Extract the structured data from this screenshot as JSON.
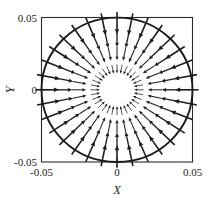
{
  "figure": {
    "name": "vector-field-plot"
  },
  "chart_data": {
    "type": "scatter",
    "subtype": "quiver-vector-field",
    "title": "",
    "subtitle": "",
    "xlabel": "X",
    "ylabel": "Y",
    "xlim": [
      -0.05,
      0.05
    ],
    "ylim": [
      -0.05,
      0.05
    ],
    "xticks": [
      -0.05,
      0,
      0.05
    ],
    "yticks": [
      -0.05,
      0,
      0.05
    ],
    "xticklabels": [
      "-0.05",
      "0",
      "0.05"
    ],
    "yticklabels": [
      "-0.05",
      "0",
      "0.05"
    ],
    "grid": false,
    "legend": null,
    "legend_position": "none",
    "frame": "box",
    "annotations": [],
    "boundary": {
      "shape": "circle",
      "center": [
        0,
        0
      ],
      "radius": 0.05,
      "description": "circular domain boundary inscribed in the square axes frame"
    },
    "field": {
      "description": "radially inward-pointing vector field; all arrows converge on the origin",
      "direction": "inward",
      "symmetry": "radial",
      "magnitude_rule": "arrow length increases with radial distance from the origin",
      "n_spokes": 32,
      "arrows_per_spoke": 4,
      "spoke_angles_deg": [
        0,
        11.25,
        22.5,
        33.75,
        45,
        56.25,
        67.5,
        78.75,
        90,
        101.25,
        112.5,
        123.75,
        135,
        146.25,
        157.5,
        168.75,
        180,
        191.25,
        202.5,
        213.75,
        225,
        236.25,
        247.5,
        258.75,
        270,
        281.25,
        292.5,
        303.75,
        315,
        326.25,
        337.5,
        348.75
      ],
      "radii": [
        0.0145,
        0.0252,
        0.0358,
        0.0462
      ]
    },
    "colors": {
      "background": "#ffffff",
      "frame": "#2b2b2b",
      "circle": "#1a1a1a",
      "arrow": "#1c1c1c",
      "text": "#191919"
    }
  },
  "axes": {
    "x_title": "X",
    "y_title": "Y",
    "x_tick_left": "-0.05",
    "x_tick_mid": "0",
    "x_tick_right": "0.05",
    "y_tick_top": "0.05",
    "y_tick_mid": "0",
    "y_tick_bottom": "-0.05"
  }
}
